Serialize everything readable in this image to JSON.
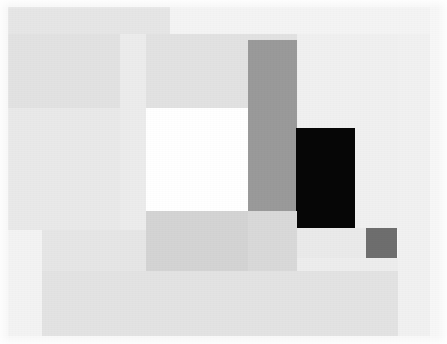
{
  "artwork": {
    "title": "Abstract Geometric Composition",
    "width": 447,
    "height": 344,
    "background_color": "#ffffff",
    "palette": {
      "paper_white": "#ffffff",
      "near_white": "#fafafa",
      "pale_gray_1": "#f2f2f2",
      "pale_gray_2": "#eeeeee",
      "pale_gray_3": "#ebebeb",
      "light_gray_1": "#e8e8e8",
      "light_gray_2": "#e4e4e4",
      "light_gray_3": "#e0e0e0",
      "mid_light_gray": "#dcdcdc",
      "mid_gray": "#d6d6d6",
      "band_gray": "#d0d0d0",
      "medium_gray": "#9a9a9a",
      "dark_gray": "#6e6e6e",
      "black": "#060606"
    },
    "shapes": [
      {
        "name": "canvas-field",
        "role": "outermost pale field covering the full picture area",
        "color": "#f7f7f7",
        "x": 0,
        "y": 0,
        "w": 447,
        "h": 344,
        "opacity": 1
      },
      {
        "name": "upper-left-broad-band",
        "role": "wide pale band across the upper left, slightly inset from edges",
        "color": "#e6e6e6",
        "x": 8,
        "y": 7,
        "w": 162,
        "h": 27,
        "opacity": 1
      },
      {
        "name": "upper-right-pale-panel",
        "role": "very pale panel filling the upper right",
        "color": "#f4f4f4",
        "x": 170,
        "y": 7,
        "w": 260,
        "h": 27,
        "opacity": 1
      },
      {
        "name": "left-tall-column",
        "role": "tall light column down the left side",
        "color": "#e9e9e9",
        "x": 8,
        "y": 34,
        "w": 112,
        "h": 196,
        "opacity": 1
      },
      {
        "name": "upper-wide-gray-band",
        "role": "broad gray band spanning most of the width below the top margin",
        "color": "#e2e2e2",
        "x": 8,
        "y": 34,
        "w": 422,
        "h": 74,
        "opacity": 1
      },
      {
        "name": "center-left-light-block",
        "role": "light block left of the white rectangle",
        "color": "#ececec",
        "x": 120,
        "y": 34,
        "w": 26,
        "h": 196,
        "opacity": 1
      },
      {
        "name": "mid-right-pale-field",
        "role": "pale field occupying the right-centre of the composition",
        "color": "#f0f0f0",
        "x": 297,
        "y": 34,
        "w": 133,
        "h": 196,
        "opacity": 1
      },
      {
        "name": "white-rectangle",
        "role": "bright white rectangle, the lightest accent in the composition",
        "color": "#ffffff",
        "x": 146,
        "y": 108,
        "w": 102,
        "h": 103,
        "opacity": 1
      },
      {
        "name": "medium-gray-vertical-bar",
        "role": "medium gray vertical bar right of the white rectangle",
        "color": "#9a9a9a",
        "x": 248,
        "y": 40,
        "w": 49,
        "h": 171,
        "opacity": 1
      },
      {
        "name": "black-rectangle",
        "role": "solid black rectangle, the darkest accent in the composition",
        "color": "#060606",
        "x": 296,
        "y": 128,
        "w": 59,
        "h": 100,
        "opacity": 1
      },
      {
        "name": "mid-gray-horizontal-band",
        "role": "mid gray band running beneath the white rectangle",
        "color": "#d4d4d4",
        "x": 146,
        "y": 211,
        "w": 151,
        "h": 60,
        "opacity": 1
      },
      {
        "name": "lower-left-wide-band",
        "role": "wide pale band across the lower left quadrant",
        "color": "#e6e6e6",
        "x": 8,
        "y": 230,
        "w": 138,
        "h": 106,
        "opacity": 1
      },
      {
        "name": "dark-gray-square",
        "role": "small dark gray square at the lower right",
        "color": "#6e6e6e",
        "x": 366,
        "y": 228,
        "w": 31,
        "h": 30,
        "opacity": 1
      },
      {
        "name": "lower-right-pale-band",
        "role": "pale band filling the lower right area",
        "color": "#ededed",
        "x": 297,
        "y": 258,
        "w": 133,
        "h": 78,
        "opacity": 1
      },
      {
        "name": "bottom-wide-band",
        "role": "broad light band along the bottom of the composition",
        "color": "#e3e3e3",
        "x": 8,
        "y": 271,
        "w": 422,
        "h": 65,
        "opacity": 1
      },
      {
        "name": "lower-left-bright-patch",
        "role": "brighter pale patch at the lower left corner",
        "color": "#f3f3f3",
        "x": 8,
        "y": 230,
        "w": 34,
        "h": 106,
        "opacity": 1
      },
      {
        "name": "right-edge-pale-strip",
        "role": "pale vertical strip along the right margin",
        "color": "#f1f1f1",
        "x": 398,
        "y": 34,
        "w": 32,
        "h": 302,
        "opacity": 1
      },
      {
        "name": "gray-bar-lower-shadow",
        "role": "slightly darker continuation beneath the medium gray bar",
        "color": "#d9d9d9",
        "x": 248,
        "y": 211,
        "w": 49,
        "h": 60,
        "opacity": 1
      },
      {
        "name": "black-rect-lower-field",
        "role": "light field directly below the black rectangle",
        "color": "#eaeaea",
        "x": 297,
        "y": 228,
        "w": 69,
        "h": 30,
        "opacity": 1
      }
    ]
  }
}
